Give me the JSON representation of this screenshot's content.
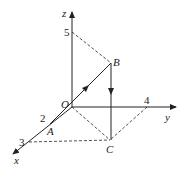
{
  "diagram": {
    "type": "3d-coordinate-system",
    "axes": {
      "x": {
        "label": "x",
        "tick": "3"
      },
      "y": {
        "label": "y",
        "tick": "4"
      },
      "z": {
        "label": "z",
        "tick": "5"
      }
    },
    "points": {
      "origin": "O",
      "A": {
        "label": "A",
        "tick": "2"
      },
      "B": {
        "label": "B"
      },
      "C": {
        "label": "C"
      }
    },
    "colors": {
      "stroke": "#222222",
      "background": "#ffffff"
    }
  }
}
